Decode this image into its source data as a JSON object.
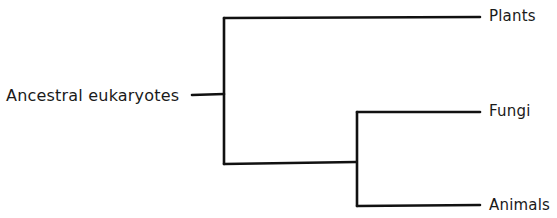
{
  "diagram": {
    "type": "phylogenetic-tree",
    "root": {
      "label": "Ancestral eukaryotes"
    },
    "leaves": [
      {
        "label": "Plants"
      },
      {
        "label": "Fungi"
      },
      {
        "label": "Animals"
      }
    ],
    "structure": {
      "root": "Ancestral eukaryotes",
      "children": [
        {
          "label": "Plants"
        },
        {
          "children": [
            {
              "label": "Fungi"
            },
            {
              "label": "Animals"
            }
          ]
        }
      ]
    },
    "colors": {
      "line": "#111111",
      "text": "#1a1a1a",
      "background": "#ffffff"
    }
  }
}
